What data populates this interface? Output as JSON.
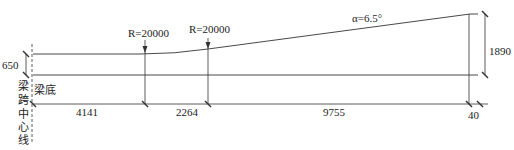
{
  "diagram": {
    "type": "beam-profile-elevation",
    "labels": {
      "radius_left": "R=20000",
      "radius_right": "R=20000",
      "angle": "α=6.5°",
      "beam_bottom": "梁底",
      "centerline": [
        "梁",
        "跨",
        "中",
        "心",
        "线"
      ]
    },
    "dimensions": {
      "left_height": "650",
      "right_height": "1890",
      "segments": [
        "4141",
        "2264",
        "9755",
        "40"
      ]
    },
    "colors": {
      "line": "#333333",
      "text": "#222222",
      "background": "#ffffff"
    }
  }
}
